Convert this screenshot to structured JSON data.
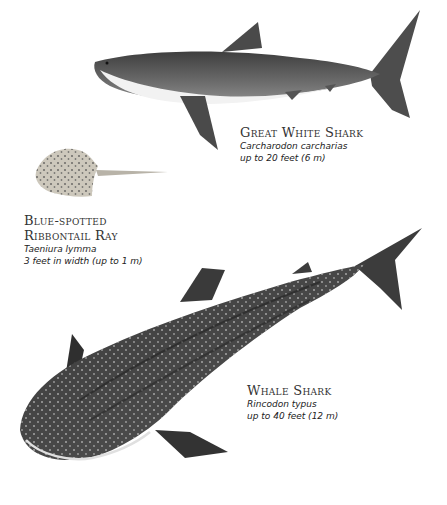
{
  "species": [
    {
      "common_name": "Great White Shark",
      "scientific_name": "Carcharodon carcharias",
      "size": "up to 20 feet (6 m)"
    },
    {
      "common_name_line1": "Blue-spotted",
      "common_name_line2": "Ribbontail Ray",
      "scientific_name": "Taeniura lymma",
      "size": "3 feet in width (up to 1 m)"
    },
    {
      "common_name": "Whale Shark",
      "scientific_name": "Rincodon typus",
      "size": "up to 40 feet (12 m)"
    }
  ],
  "colors": {
    "background": "#ffffff",
    "shark_gray": "#5a5a5a",
    "ray_sand": "#c9c4b8"
  }
}
